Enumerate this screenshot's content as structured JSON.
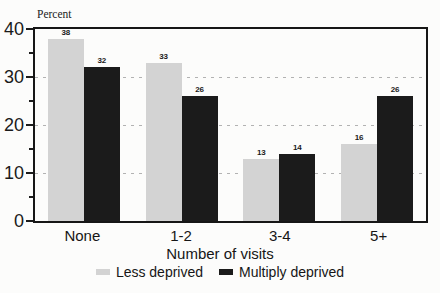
{
  "figure": {
    "background": "#fcfcfb",
    "frame_color": "#161616",
    "gridline_color": "#b2b2b2"
  },
  "chart_data": {
    "type": "bar",
    "title": "",
    "ylabel": "Percent",
    "xlabel": "Number of visits",
    "categories": [
      "None",
      "1-2",
      "3-4",
      "5+"
    ],
    "series": [
      {
        "name": "Less deprived",
        "color": "#d3d3d3",
        "values": [
          38,
          33,
          13,
          16
        ]
      },
      {
        "name": "Multiply deprived",
        "color": "#1b1b1b",
        "values": [
          32,
          26,
          14,
          26
        ]
      }
    ],
    "ylim": [
      0,
      40
    ],
    "yticks_major": [
      0,
      10,
      20,
      30,
      40
    ],
    "yticks_minor": [
      5,
      15,
      25,
      35
    ],
    "gridlines": [
      10,
      20,
      30
    ],
    "grid_style": "dashed",
    "legend_position": "bottom",
    "value_labels": true
  }
}
